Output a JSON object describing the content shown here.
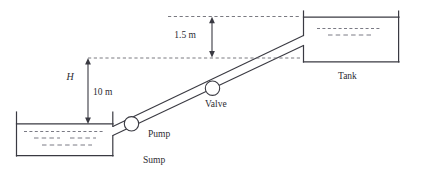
{
  "diagram": {
    "type": "pumping-system-schematic",
    "labels": {
      "sump": "Sump",
      "pump": "Pump",
      "valve": "Valve",
      "tank": "Tank",
      "head_symbol": "H",
      "head_value": "10 m",
      "drop_value": "1.5 m"
    },
    "colors": {
      "line": "#3a3a42",
      "dashed_reference": "#6b6b73",
      "water_dash": "#7a7a84",
      "background": "#ffffff"
    },
    "components": [
      {
        "name": "sump",
        "label": "Sump",
        "kind": "open-reservoir"
      },
      {
        "name": "pump",
        "label": "Pump",
        "kind": "inline-circle-fitting"
      },
      {
        "name": "valve",
        "label": "Valve",
        "kind": "inline-circle-fitting"
      },
      {
        "name": "tank",
        "label": "Tank",
        "kind": "open-reservoir"
      }
    ],
    "dimensions": [
      {
        "name": "static-head",
        "symbol": "H",
        "value": "10 m",
        "orientation": "vertical",
        "style": "double-headed-arrow"
      },
      {
        "name": "tank-freeboard",
        "symbol": "",
        "value": "1.5 m",
        "orientation": "vertical",
        "style": "double-headed-arrow"
      }
    ]
  }
}
